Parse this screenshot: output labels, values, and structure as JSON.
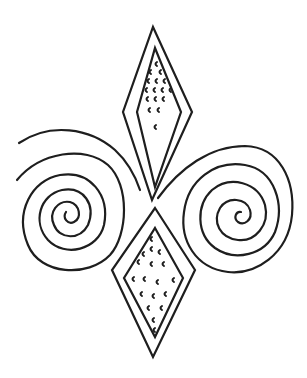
{
  "figure": {
    "colors": {
      "line": "#1e1e1e",
      "background": "#ffffff"
    },
    "elements": {
      "top_diamond": {
        "outer": [
          [
            153,
            27
          ],
          [
            192,
            112
          ],
          [
            152,
            200
          ],
          [
            123,
            112
          ]
        ],
        "inner": [
          [
            155,
            48
          ],
          [
            181,
            112
          ],
          [
            155,
            187
          ],
          [
            137,
            112
          ]
        ]
      },
      "bottom_diamond": {
        "outer": [
          [
            155,
            208
          ],
          [
            195,
            270
          ],
          [
            153,
            357
          ],
          [
            112,
            270
          ]
        ],
        "inner": [
          [
            155,
            228
          ],
          [
            183,
            278
          ],
          [
            155,
            337
          ],
          [
            124,
            278
          ]
        ]
      },
      "left_spiral": {
        "center": [
          68,
          212
        ],
        "turns": 5
      },
      "right_spiral": {
        "center": [
          239,
          209
        ],
        "turns": 5
      }
    }
  }
}
